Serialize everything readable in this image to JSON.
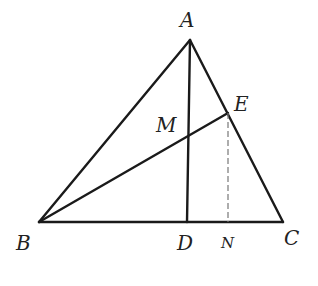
{
  "diagram": {
    "type": "geometry-triangle",
    "colors": {
      "stroke": "#1a1a1a",
      "dashed": "#777777",
      "label": "#222222",
      "background": "#ffffff"
    },
    "points": {
      "A": {
        "label": "A",
        "x": 190,
        "y": 40
      },
      "B": {
        "label": "B",
        "x": 39,
        "y": 222
      },
      "C": {
        "label": "C",
        "x": 283,
        "y": 222
      },
      "D": {
        "label": "D",
        "x": 187,
        "y": 222
      },
      "E": {
        "label": "E",
        "x": 228,
        "y": 113
      },
      "M": {
        "label": "M",
        "x": 188,
        "y": 135
      },
      "N": {
        "label": "N",
        "x": 228,
        "y": 222
      }
    },
    "segments": [
      {
        "name": "AB",
        "from": "A",
        "to": "B",
        "style": "solid"
      },
      {
        "name": "AC",
        "from": "A",
        "to": "C",
        "style": "solid"
      },
      {
        "name": "BC",
        "from": "B",
        "to": "C",
        "style": "solid"
      },
      {
        "name": "AD",
        "from": "A",
        "to": "D",
        "style": "solid"
      },
      {
        "name": "BE",
        "from": "B",
        "to": "E",
        "style": "solid"
      },
      {
        "name": "EN",
        "from": "E",
        "to": "N",
        "style": "dashed"
      }
    ],
    "labels": {
      "A": "A",
      "B": "B",
      "C": "C",
      "D": "D",
      "E": "E",
      "M": "M",
      "N": "N"
    }
  }
}
